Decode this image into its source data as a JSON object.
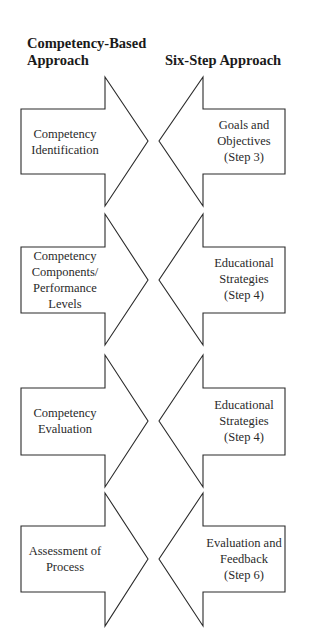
{
  "headers": {
    "left": "Competency-Based Approach",
    "right": "Six-Step Approach"
  },
  "left_column": [
    {
      "label": "Competency Identification"
    },
    {
      "label": "Competency Components/ Performance Levels"
    },
    {
      "label": "Competency Evaluation"
    },
    {
      "label": "Assessment of Process"
    }
  ],
  "right_column": [
    {
      "label": "Goals and Objectives",
      "step": "(Step 3)"
    },
    {
      "label": "Educational Strategies",
      "step": "(Step 4)"
    },
    {
      "label": "Educational Strategies",
      "step": "(Step 4)"
    },
    {
      "label": "Evaluation and Feedback",
      "step": "(Step 6)"
    }
  ],
  "colors": {
    "stroke": "#2a2a2a",
    "fill": "#ffffff",
    "text": "#1e1e1e"
  }
}
